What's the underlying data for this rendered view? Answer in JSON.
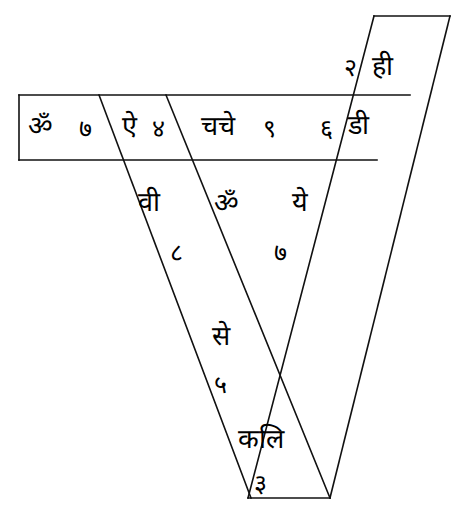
{
  "figure": {
    "background_color": "#ffffff",
    "stroke_color": "#111111",
    "text_color": "#000000",
    "width": 460,
    "height": 524
  },
  "cells": [
    {
      "id": "cell-top-right",
      "band": "right-diagonal",
      "position": "top",
      "number": "२",
      "syllable": "ही"
    },
    {
      "id": "cell-horizontal-1",
      "band": "horizontal",
      "position": "left",
      "syllable": "ॐ",
      "number": "७"
    },
    {
      "id": "cell-horizontal-2",
      "band": "horizontal",
      "position": "second",
      "syllable": "ऐ",
      "number": "४"
    },
    {
      "id": "cell-horizontal-3",
      "band": "horizontal",
      "position": "third",
      "syllable": "चचे",
      "number": "९"
    },
    {
      "id": "cell-horizontal-4",
      "band": "horizontal",
      "position": "right",
      "number": "६",
      "syllable": "डी"
    },
    {
      "id": "cell-left-band-upper",
      "band": "left-diagonal",
      "position": "upper",
      "syllable": "वी",
      "number": "८"
    },
    {
      "id": "cell-center-om",
      "band": "crossing-center",
      "position": "upper-middle",
      "syllable": "ॐ",
      "number": ""
    },
    {
      "id": "cell-right-band-upper",
      "band": "right-diagonal",
      "position": "upper",
      "syllable": "ये",
      "number": "७"
    },
    {
      "id": "cell-center-se",
      "band": "crossing-center",
      "position": "lower-middle",
      "syllable": "से",
      "number": "५"
    },
    {
      "id": "cell-bottom-kali",
      "band": "left-diagonal",
      "position": "bottom",
      "syllable": "कलि",
      "number": "३"
    }
  ],
  "labels": {
    "om": "ॐ",
    "seven_a": "७",
    "ai": "ऐ",
    "four": "४",
    "chache": "चचे",
    "nine": "९",
    "six": "६",
    "dee": "डी",
    "two": "२",
    "hee": "ही",
    "vee": "वी",
    "eight": "८",
    "om_center": "ॐ",
    "ye": "ये",
    "seven_b": "७",
    "se": "से",
    "five": "५",
    "kali": "कलि",
    "three": "३"
  }
}
